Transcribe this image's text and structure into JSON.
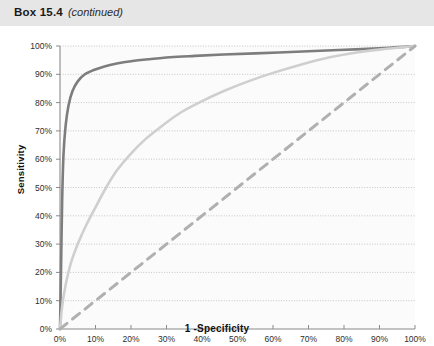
{
  "box": {
    "title": "Box 15.4",
    "subtitle": "(continued)"
  },
  "chart_data": {
    "type": "line",
    "title": "",
    "xlabel": "1 -Specificity",
    "ylabel": "Sensitivity",
    "xlim": [
      0,
      100
    ],
    "ylim": [
      0,
      100
    ],
    "grid": "horizontal-dotted",
    "legend": "none",
    "xticks": [
      "0%",
      "10%",
      "20%",
      "30%",
      "40%",
      "50%",
      "60%",
      "70%",
      "80%",
      "90%",
      "100%"
    ],
    "yticks": [
      "0%",
      "10%",
      "20%",
      "30%",
      "40%",
      "50%",
      "60%",
      "70%",
      "80%",
      "90%",
      "100%"
    ],
    "xtick_values": [
      0,
      10,
      20,
      30,
      40,
      50,
      60,
      70,
      80,
      90,
      100
    ],
    "ytick_values": [
      0,
      10,
      20,
      30,
      40,
      50,
      60,
      70,
      80,
      90,
      100
    ],
    "series": [
      {
        "name": "roc-curve-dark",
        "color": "#7d7d7d",
        "style": "solid",
        "width": 2.6,
        "x": [
          0,
          0.3,
          0.6,
          1,
          1.6,
          2.4,
          3.5,
          5,
          7,
          9.5,
          12.5,
          16,
          20,
          25,
          31,
          38,
          46,
          55,
          65,
          75,
          85,
          93,
          100
        ],
        "y": [
          0,
          22,
          45,
          62,
          72,
          79,
          84,
          87.5,
          90,
          91.5,
          92.8,
          93.8,
          94.6,
          95.3,
          96,
          96.5,
          97,
          97.4,
          97.9,
          98.4,
          98.9,
          99.4,
          100
        ]
      },
      {
        "name": "roc-curve-light",
        "color": "#cfcfcf",
        "style": "solid",
        "width": 2.6,
        "x": [
          0,
          0.6,
          1.5,
          3,
          5,
          7.5,
          10,
          13,
          16,
          20,
          24,
          29,
          34,
          40,
          46,
          53,
          60,
          68,
          76,
          84,
          92,
          100
        ],
        "y": [
          0,
          8,
          15,
          23,
          30,
          37,
          43,
          50,
          56,
          62,
          67,
          72,
          76.5,
          80.5,
          84,
          87.5,
          90.5,
          93.5,
          96,
          97.8,
          99,
          100
        ]
      },
      {
        "name": "reference-diagonal",
        "color": "#b0b0b0",
        "style": "dashed",
        "width": 3.0,
        "x": [
          0,
          100
        ],
        "y": [
          0,
          100
        ]
      }
    ]
  }
}
